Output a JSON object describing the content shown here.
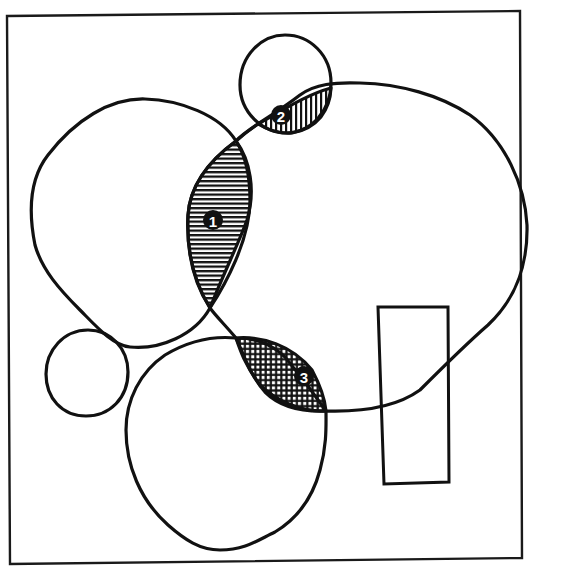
{
  "diagram": {
    "colors": {
      "ink": "#111111",
      "background": "#ffffff"
    },
    "regions": [
      {
        "id": 1,
        "label": "1",
        "pattern": "horizontal-lines",
        "location": "overlap of upper-left blob and large right blob"
      },
      {
        "id": 2,
        "label": "2",
        "pattern": "vertical-lines",
        "location": "overlap of top small circle and large right blob"
      },
      {
        "id": 3,
        "label": "3",
        "pattern": "crosshatch",
        "location": "overlap of bottom blob and large right blob"
      }
    ],
    "shapes": [
      "outer-frame",
      "upper-left-blob",
      "top-small-circle",
      "large-right-blob",
      "small-left-circle",
      "bottom-blob",
      "tall-rectangle"
    ]
  }
}
